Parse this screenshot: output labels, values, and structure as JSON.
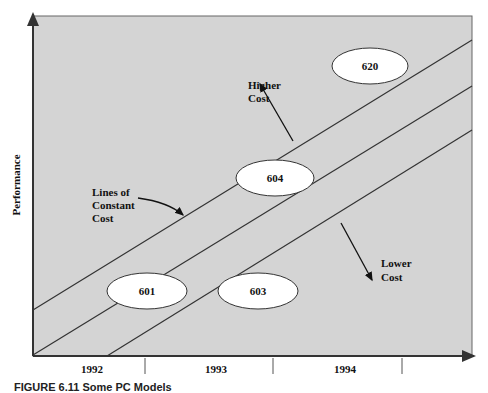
{
  "axes": {
    "y_label": "Performance",
    "x_ticks": [
      "1992",
      "1993",
      "1994"
    ]
  },
  "models": [
    {
      "label": "601"
    },
    {
      "label": "603"
    },
    {
      "label": "604"
    },
    {
      "label": "620"
    }
  ],
  "annotations": {
    "lines_of_constant_cost": [
      "Lines of",
      "Constant",
      "Cost"
    ],
    "higher_cost": [
      "Higher",
      "Cost"
    ],
    "lower_cost": [
      "Lower",
      "Cost"
    ]
  },
  "caption": "FIGURE 6.11 Some PC Models",
  "colors": {
    "plot_background": "#d4d4d4",
    "oval_fill": "#ffffff",
    "line": "#333333"
  }
}
